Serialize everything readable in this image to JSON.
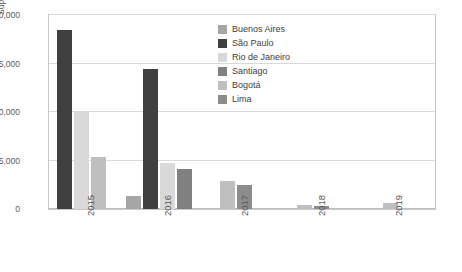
{
  "chart_data": {
    "type": "bar",
    "title": "",
    "subtitle": "",
    "xlabel": "",
    "ylabel": "Supply projected surface (sq m)",
    "categories": [
      "2015",
      "2016",
      "2017",
      "2018",
      "2019"
    ],
    "ylim": [
      0,
      9000000
    ],
    "ytick_labels": [
      "0",
      "2,25,000",
      "4,50,000",
      "6,75,000",
      "9,00,000"
    ],
    "ytick_values": [
      0,
      2250000,
      4500000,
      6750000,
      9000000
    ],
    "grid": true,
    "legend_position": "inside-top-right",
    "series": [
      {
        "name": "Buenos Aires",
        "color": "#a6a6a6",
        "values": [
          0,
          600000,
          0,
          0,
          0
        ]
      },
      {
        "name": "São Paulo",
        "color": "#3f3f3f",
        "values": [
          8300000,
          6500000,
          0,
          0,
          0
        ]
      },
      {
        "name": "Rio de Janeiro",
        "color": "#d9d9d9",
        "values": [
          4500000,
          2150000,
          0,
          0,
          0
        ]
      },
      {
        "name": "Santiago",
        "color": "#808080",
        "values": [
          0,
          1850000,
          0,
          0,
          0
        ]
      },
      {
        "name": "Bogotá",
        "color": "#bfbfbf",
        "values": [
          2400000,
          0,
          1300000,
          180000,
          270000
        ]
      },
      {
        "name": "Lima",
        "color": "#8c8c8c",
        "values": [
          0,
          0,
          1100000,
          130000,
          0
        ]
      }
    ]
  }
}
